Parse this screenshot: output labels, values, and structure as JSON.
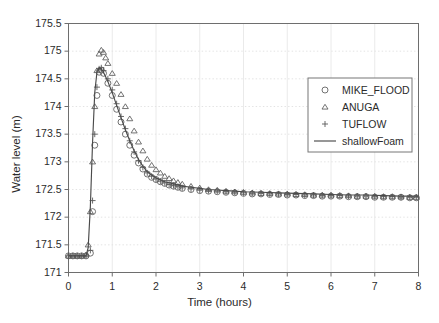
{
  "chart_data": {
    "type": "line",
    "title": "",
    "xlabel": "Time (hours)",
    "ylabel": "Water level (m)",
    "xlim": [
      0,
      8
    ],
    "ylim": [
      171,
      175.5
    ],
    "xticks": [
      0,
      1,
      2,
      3,
      4,
      5,
      6,
      7,
      8
    ],
    "xtick_labels": [
      "0",
      "1",
      "2",
      "3",
      "4",
      "5",
      "6",
      "7",
      "8"
    ],
    "yticks": [
      171,
      171.5,
      172,
      172.5,
      173,
      173.5,
      174,
      174.5,
      175,
      175.5
    ],
    "ytick_labels": [
      "171",
      "171.5",
      "172",
      "172.5",
      "173",
      "173.5",
      "174",
      "174.5",
      "175",
      "175.5"
    ],
    "grid": true,
    "grid_color": "#dcdcdc",
    "frame_color": "#6e6e6e",
    "legend_position": "upper right",
    "legend_border": true,
    "series": [
      {
        "name": "MIKE_FLOOD",
        "marker": "circle",
        "color": "#5a5a5a",
        "x": [
          0.0,
          0.1,
          0.2,
          0.3,
          0.4,
          0.5,
          0.55,
          0.6,
          0.65,
          0.7,
          0.75,
          0.8,
          0.9,
          1.0,
          1.1,
          1.2,
          1.3,
          1.4,
          1.5,
          1.6,
          1.7,
          1.8,
          1.9,
          2.0,
          2.1,
          2.2,
          2.3,
          2.4,
          2.5,
          2.6,
          2.8,
          3.0,
          3.2,
          3.4,
          3.6,
          3.8,
          4.0,
          4.2,
          4.4,
          4.6,
          4.8,
          5.0,
          5.2,
          5.4,
          5.6,
          5.8,
          6.0,
          6.2,
          6.4,
          6.6,
          6.8,
          7.0,
          7.2,
          7.4,
          7.6,
          7.8,
          7.95
        ],
        "y": [
          171.3,
          171.3,
          171.3,
          171.3,
          171.3,
          171.35,
          172.1,
          173.3,
          174.2,
          174.62,
          174.66,
          174.6,
          174.42,
          174.2,
          173.95,
          173.72,
          173.5,
          173.3,
          173.12,
          172.98,
          172.87,
          172.78,
          172.72,
          172.68,
          172.64,
          172.61,
          172.58,
          172.56,
          172.54,
          172.52,
          172.5,
          172.48,
          172.47,
          172.46,
          172.45,
          172.44,
          172.43,
          172.42,
          172.42,
          172.41,
          172.41,
          172.4,
          172.4,
          172.39,
          172.39,
          172.38,
          172.38,
          172.38,
          172.37,
          172.37,
          172.37,
          172.36,
          172.36,
          172.36,
          172.36,
          172.35,
          172.35
        ]
      },
      {
        "name": "ANUGA",
        "marker": "triangle",
        "color": "#5a5a5a",
        "x": [
          0.0,
          0.1,
          0.2,
          0.3,
          0.4,
          0.45,
          0.5,
          0.55,
          0.6,
          0.65,
          0.7,
          0.75,
          0.8,
          0.85,
          0.9,
          1.0,
          1.1,
          1.2,
          1.3,
          1.4,
          1.5,
          1.6,
          1.7,
          1.8,
          1.9,
          2.0,
          2.1,
          2.2,
          2.3,
          2.4,
          2.5,
          2.6,
          2.8,
          3.0,
          3.2,
          3.4,
          3.6,
          3.8,
          4.0,
          4.2,
          4.4,
          4.6,
          4.8,
          5.0,
          5.2,
          5.4,
          5.6,
          5.8,
          6.0,
          6.2,
          6.4,
          6.6,
          6.8,
          7.0,
          7.2,
          7.4,
          7.6,
          7.8,
          7.95
        ],
        "y": [
          171.3,
          171.3,
          171.3,
          171.3,
          171.32,
          171.5,
          172.1,
          173.0,
          174.0,
          174.65,
          174.95,
          175.02,
          174.98,
          174.88,
          174.78,
          174.6,
          174.42,
          174.22,
          174.0,
          173.78,
          173.56,
          173.36,
          173.2,
          173.05,
          172.94,
          172.86,
          172.8,
          172.74,
          172.7,
          172.66,
          172.63,
          172.6,
          172.56,
          172.53,
          172.5,
          172.49,
          172.47,
          172.46,
          172.45,
          172.44,
          172.43,
          172.43,
          172.42,
          172.42,
          172.41,
          172.41,
          172.4,
          172.4,
          172.4,
          172.39,
          172.39,
          172.38,
          172.38,
          172.38,
          172.37,
          172.37,
          172.37,
          172.36,
          172.36
        ]
      },
      {
        "name": "TUFLOW",
        "marker": "plus",
        "color": "#5a5a5a",
        "x": [
          0.0,
          0.1,
          0.2,
          0.3,
          0.4,
          0.5,
          0.55,
          0.6,
          0.65,
          0.7,
          0.75,
          0.8,
          0.9,
          1.0,
          1.1,
          1.2,
          1.3,
          1.4,
          1.5,
          1.6,
          1.7,
          1.8,
          1.9,
          2.0,
          2.1,
          2.2,
          2.3,
          2.4,
          2.5,
          2.6,
          2.8,
          3.0,
          3.2,
          3.4,
          3.6,
          3.8,
          4.0,
          4.2,
          4.4,
          4.6,
          4.8,
          5.0,
          5.2,
          5.4,
          5.6,
          5.8,
          6.0,
          6.2,
          6.4,
          6.6,
          6.8,
          7.0,
          7.2,
          7.4,
          7.6,
          7.8,
          7.95
        ],
        "y": [
          171.3,
          171.3,
          171.3,
          171.3,
          171.3,
          171.4,
          172.3,
          173.5,
          174.35,
          174.68,
          174.7,
          174.65,
          174.5,
          174.3,
          174.05,
          173.82,
          173.6,
          173.38,
          173.18,
          173.02,
          172.9,
          172.8,
          172.74,
          172.69,
          172.65,
          172.62,
          172.59,
          172.57,
          172.55,
          172.53,
          172.51,
          172.49,
          172.48,
          172.47,
          172.46,
          172.45,
          172.44,
          172.43,
          172.43,
          172.42,
          172.42,
          172.41,
          172.41,
          172.4,
          172.4,
          172.39,
          172.39,
          172.39,
          172.38,
          172.38,
          172.38,
          172.37,
          172.37,
          172.37,
          172.36,
          172.36,
          172.36
        ]
      },
      {
        "name": "shallowFoam",
        "marker": "none",
        "line": true,
        "color": "#4a4a4a",
        "x": [
          0.0,
          0.2,
          0.4,
          0.45,
          0.5,
          0.55,
          0.6,
          0.65,
          0.7,
          0.75,
          0.8,
          0.9,
          1.0,
          1.1,
          1.2,
          1.3,
          1.4,
          1.5,
          1.6,
          1.7,
          1.8,
          1.9,
          2.0,
          2.2,
          2.4,
          2.6,
          2.8,
          3.0,
          3.2,
          3.4,
          3.6,
          3.8,
          4.0,
          4.4,
          4.8,
          5.2,
          5.6,
          6.0,
          6.4,
          6.8,
          7.2,
          7.6,
          8.0
        ],
        "y": [
          171.3,
          171.3,
          171.3,
          171.45,
          172.2,
          173.35,
          174.25,
          174.62,
          174.7,
          174.68,
          174.62,
          174.45,
          174.25,
          174.02,
          173.8,
          173.58,
          173.38,
          173.2,
          173.04,
          172.92,
          172.82,
          172.76,
          172.71,
          172.64,
          172.6,
          172.56,
          172.54,
          172.52,
          172.5,
          172.49,
          172.48,
          172.47,
          172.46,
          172.45,
          172.44,
          172.43,
          172.42,
          172.41,
          172.4,
          172.4,
          172.39,
          172.38,
          172.38
        ]
      }
    ],
    "legend_entries": [
      {
        "label": "MIKE_FLOOD",
        "marker": "circle"
      },
      {
        "label": "ANUGA",
        "marker": "triangle"
      },
      {
        "label": "TUFLOW",
        "marker": "plus"
      },
      {
        "label": "shallowFoam",
        "marker": "line"
      }
    ]
  }
}
